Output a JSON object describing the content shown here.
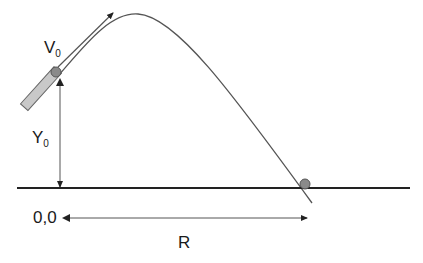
{
  "diagram": {
    "labels": {
      "velocity": "V",
      "velocity_sub": "0",
      "height": "Y",
      "height_sub": "0",
      "origin": "0,0",
      "range": "R"
    },
    "colors": {
      "line": "#555555",
      "ground": "#222222",
      "ball": "#8a8a8a",
      "launcher": "#c8c8c8"
    }
  }
}
